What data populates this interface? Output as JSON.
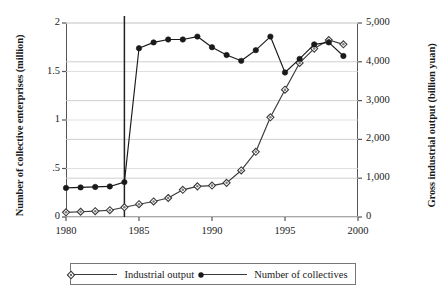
{
  "chart_data": {
    "type": "line",
    "title": "",
    "xlabel": "",
    "x": [
      1980,
      1981,
      1982,
      1983,
      1984,
      1985,
      1986,
      1987,
      1988,
      1989,
      1990,
      1991,
      1992,
      1993,
      1994,
      1995,
      1996,
      1997,
      1998,
      1999
    ],
    "xlim": [
      1980,
      2000
    ],
    "xticks": [
      1980,
      1985,
      1990,
      1995,
      2000
    ],
    "xticklabels": [
      "1980",
      "1985",
      "1990",
      "1995",
      "2000"
    ],
    "grid": true,
    "legend_position": "bottom",
    "annotations": [
      {
        "type": "vline",
        "x": 1984,
        "label": ""
      }
    ],
    "axes": [
      {
        "id": "left",
        "ylabel": "Number of collective enterprises (million)",
        "ylim": [
          0,
          2
        ],
        "yticks": [
          0,
          0.5,
          1,
          1.5,
          2
        ],
        "yticklabels": [
          "0",
          ".5",
          "1",
          "1.5",
          "2"
        ]
      },
      {
        "id": "right",
        "ylabel": "Gross industrial output (billion yuan)",
        "ylim": [
          0,
          5000
        ],
        "yticks": [
          0,
          1000,
          2000,
          3000,
          4000,
          5000
        ],
        "yticklabels": [
          "0",
          "1,000",
          "2,000",
          "3,000",
          "4,000",
          "5,000"
        ]
      }
    ],
    "series": [
      {
        "name": "Industrial output",
        "axis": "right",
        "marker": "open-diamond",
        "color": "#3a3a3a",
        "values": [
          120,
          135,
          150,
          175,
          250,
          330,
          400,
          490,
          700,
          790,
          810,
          880,
          1200,
          1680,
          2570,
          3280,
          3970,
          4340,
          4560,
          4450
        ]
      },
      {
        "name": "Number of collectives",
        "axis": "left",
        "marker": "filled-circle",
        "color": "#1a1a1a",
        "values": [
          0.3,
          0.305,
          0.31,
          0.315,
          0.36,
          1.74,
          1.8,
          1.83,
          1.83,
          1.86,
          1.75,
          1.67,
          1.61,
          1.72,
          1.86,
          1.49,
          1.63,
          1.78,
          1.8,
          1.66
        ]
      }
    ]
  },
  "labels": {
    "ylabel_left": "Number of collective enterprises (million)",
    "ylabel_right": "Gross industrial output (billion yuan)",
    "legend": [
      {
        "key": "industrial-output",
        "label": "Industrial output"
      },
      {
        "key": "number-of-collectives",
        "label": "Number of collectives"
      }
    ]
  }
}
